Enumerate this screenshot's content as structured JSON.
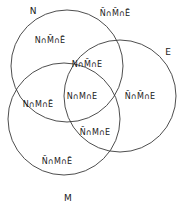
{
  "figure": {
    "background_color": "#ffffff",
    "stroke_color": "#3a3a3a",
    "text_color": "#1a1a1a"
  },
  "set_labels": [
    {
      "name": "set-label-n",
      "text": "N",
      "x": 33,
      "y": 11
    },
    {
      "name": "set-label-e",
      "text": "E",
      "x": 168,
      "y": 52
    },
    {
      "name": "set-label-m",
      "text": "M",
      "x": 68,
      "y": 198
    }
  ],
  "circles": [
    {
      "name": "circle-n",
      "label": "N",
      "cx": 67,
      "cy": 66,
      "r": 56
    },
    {
      "name": "circle-e",
      "label": "E",
      "cx": 120,
      "cy": 96,
      "r": 56
    },
    {
      "name": "circle-m",
      "label": "M",
      "cx": 64,
      "cy": 119,
      "r": 56
    }
  ],
  "regions": [
    {
      "name": "region-n-only",
      "text": "N∩M̄∩Ē",
      "x": 50,
      "y": 40,
      "sets": [
        "N"
      ]
    },
    {
      "name": "region-outside-all",
      "text": "N̄∩M̄∩Ē",
      "x": 115,
      "y": 13,
      "sets": []
    },
    {
      "name": "region-n-e",
      "text": "N∩M̄∩E",
      "x": 87,
      "y": 64,
      "sets": [
        "N",
        "E"
      ]
    },
    {
      "name": "region-n-m-e",
      "text": "N∩M∩E",
      "x": 82,
      "y": 96,
      "sets": [
        "N",
        "M",
        "E"
      ]
    },
    {
      "name": "region-n-m",
      "text": "N∩M∩Ē",
      "x": 38,
      "y": 104,
      "sets": [
        "N",
        "M"
      ]
    },
    {
      "name": "region-e-only",
      "text": "N̄∩M̄∩E",
      "x": 140,
      "y": 96,
      "sets": [
        "E"
      ]
    },
    {
      "name": "region-m-e",
      "text": "N̄∩M∩E",
      "x": 95,
      "y": 132,
      "sets": [
        "M",
        "E"
      ]
    },
    {
      "name": "region-m-only",
      "text": "N̄∩M∩Ē",
      "x": 57,
      "y": 161,
      "sets": [
        "M"
      ]
    }
  ]
}
